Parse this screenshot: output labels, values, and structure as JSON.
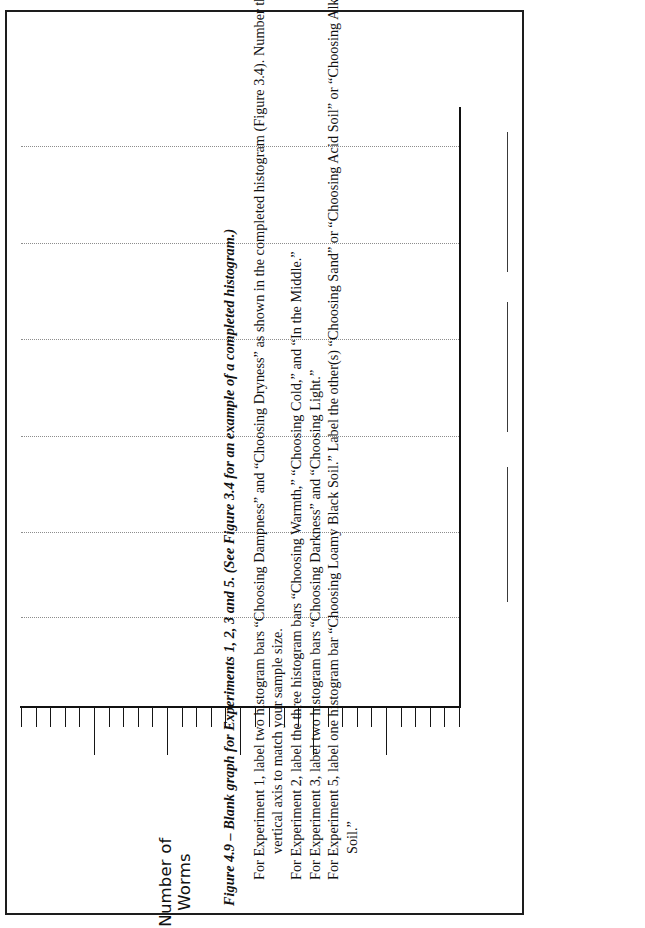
{
  "figure": {
    "caption": "Figure 4.9 – Blank graph for Experiments 1, 2, 3 and 5. (See Figure 3.4 for an example of a completed histogram.)",
    "axis_title_line1": "Number of",
    "axis_title_line2": "Worms"
  },
  "instructions": [
    {
      "text": "For Experiment 1, label two histogram bars “Choosing Dampness” and “Choosing Dryness” as shown in the completed histogram (Figure 3.4). Number the",
      "indent": "first"
    },
    {
      "text": "vertical axis to match your sample size.",
      "indent": "cont"
    },
    {
      "text": "For Experiment 2, label the three histogram bars “Choosing Warmth,” “Choosing Cold,” and “In the Middle.”",
      "indent": "first"
    },
    {
      "text": "For Experiment 3, label two histogram bars “Choosing Darkness” and “Choosing Light.”",
      "indent": "first"
    },
    {
      "text": "For Experiment 5, label one histogram bar “Choosing Loamy Black Soil.” Label the other(s) “Choosing Sand” or “Choosing Acid Soil” or “Choosing Alkaline",
      "indent": "first"
    },
    {
      "text": "Soil.”",
      "indent": "cont"
    }
  ],
  "chart_data": {
    "type": "bar",
    "title": "Blank graph for Experiments 1, 2, 3 and 5",
    "xlabel": "",
    "ylabel": "Number of Worms",
    "categories": [],
    "values": [],
    "grid": true,
    "gridline_count": 6,
    "legend": "none",
    "note": "Blank histogram template — no bars are drawn. Value axis is an unlabelled ruled scale with 30 minor ticks and a longer tick every 5th division; 6 dotted gridlines span the plot."
  },
  "axis": {
    "minor_tick_count": 30,
    "major_tick_every": 5,
    "tick_labels": [],
    "gridlines_y": [
      134,
      231,
      327,
      424,
      520,
      605
    ]
  },
  "answer_rules": {
    "count": 3,
    "description": "three blank ruled answer lines to the right of the plot"
  },
  "colors": {
    "ink": "#111111",
    "grid": "#8d8d8d",
    "page": "#ffffff",
    "border": "#1d1d1d"
  }
}
